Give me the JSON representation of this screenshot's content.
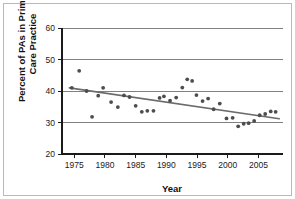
{
  "chart_data": {
    "type": "scatter",
    "title": "",
    "xlabel": "Year",
    "ylabel": "Percent of PAs in Primary Care Practice",
    "xlim": [
      1973.0,
      2009.0
    ],
    "ylim": [
      20,
      60
    ],
    "xticks": [
      1975,
      1980,
      1985,
      1990,
      1995,
      2000,
      2005
    ],
    "yticks": [
      20,
      30,
      40,
      50,
      60
    ],
    "xtick_labels": [
      "1975",
      "1980",
      "1985",
      "1990",
      "1995",
      "2000",
      "2005"
    ],
    "ytick_labels": [
      "20",
      "30",
      "40",
      "50",
      "60"
    ],
    "grid": "horizontal",
    "legend": "none",
    "point_color": "#4d4d4d",
    "line_color": "#6b6b6b",
    "grid_color": "#808080",
    "axis_color": "#1a1a1a",
    "x": [
      1974.6,
      1975.8,
      1977.0,
      1977.9,
      1978.9,
      1979.7,
      1981.0,
      1982.1,
      1983.1,
      1984.0,
      1985.0,
      1986.0,
      1986.9,
      1987.9,
      1988.9,
      1989.6,
      1990.6,
      1991.6,
      1992.6,
      1993.4,
      1994.2,
      1994.9,
      1995.9,
      1996.8,
      1997.7,
      1998.7,
      1999.8,
      2000.8,
      2001.7,
      2002.6,
      2003.4,
      2004.3,
      2005.2,
      2006.1,
      2007.0,
      2007.8
    ],
    "y": [
      41.0,
      46.4,
      40.0,
      31.8,
      38.5,
      41.0,
      36.5,
      34.9,
      38.6,
      38.1,
      35.3,
      33.4,
      33.7,
      33.7,
      37.8,
      38.3,
      36.9,
      37.9,
      41.1,
      43.7,
      43.2,
      38.7,
      36.8,
      37.6,
      34.2,
      36.0,
      31.3,
      31.5,
      28.8,
      29.6,
      29.8,
      30.5,
      32.3,
      32.7,
      33.5,
      33.4
    ],
    "series": [
      {
        "name": "Percent of PAs in primary care practice",
        "kind": "scatter",
        "points": [
          {
            "x": 1974.6,
            "y": 41.0
          },
          {
            "x": 1975.8,
            "y": 46.4
          },
          {
            "x": 1977.0,
            "y": 40.0
          },
          {
            "x": 1977.9,
            "y": 31.8
          },
          {
            "x": 1978.9,
            "y": 38.5
          },
          {
            "x": 1979.7,
            "y": 41.0
          },
          {
            "x": 1981.0,
            "y": 36.5
          },
          {
            "x": 1982.1,
            "y": 34.9
          },
          {
            "x": 1983.1,
            "y": 38.6
          },
          {
            "x": 1984.0,
            "y": 38.1
          },
          {
            "x": 1985.0,
            "y": 35.3
          },
          {
            "x": 1986.0,
            "y": 33.4
          },
          {
            "x": 1986.9,
            "y": 33.7
          },
          {
            "x": 1987.9,
            "y": 33.7
          },
          {
            "x": 1988.9,
            "y": 37.8
          },
          {
            "x": 1989.6,
            "y": 38.3
          },
          {
            "x": 1990.6,
            "y": 36.9
          },
          {
            "x": 1991.6,
            "y": 37.9
          },
          {
            "x": 1992.6,
            "y": 41.1
          },
          {
            "x": 1993.4,
            "y": 43.7
          },
          {
            "x": 1994.2,
            "y": 43.2
          },
          {
            "x": 1994.9,
            "y": 38.7
          },
          {
            "x": 1995.9,
            "y": 36.8
          },
          {
            "x": 1996.8,
            "y": 37.6
          },
          {
            "x": 1997.7,
            "y": 34.2
          },
          {
            "x": 1998.7,
            "y": 36.0
          },
          {
            "x": 1999.8,
            "y": 31.3
          },
          {
            "x": 2000.8,
            "y": 31.5
          },
          {
            "x": 2001.7,
            "y": 28.8
          },
          {
            "x": 2002.6,
            "y": 29.6
          },
          {
            "x": 2003.4,
            "y": 29.8
          },
          {
            "x": 2004.3,
            "y": 30.5
          },
          {
            "x": 2005.2,
            "y": 32.3
          },
          {
            "x": 2006.1,
            "y": 32.7
          },
          {
            "x": 2007.0,
            "y": 33.5
          },
          {
            "x": 2007.8,
            "y": 33.4
          }
        ]
      },
      {
        "name": "Linear trend line",
        "kind": "line",
        "points": [
          {
            "x": 1974.2,
            "y": 41.0
          },
          {
            "x": 2008.4,
            "y": 31.2
          }
        ]
      }
    ]
  }
}
